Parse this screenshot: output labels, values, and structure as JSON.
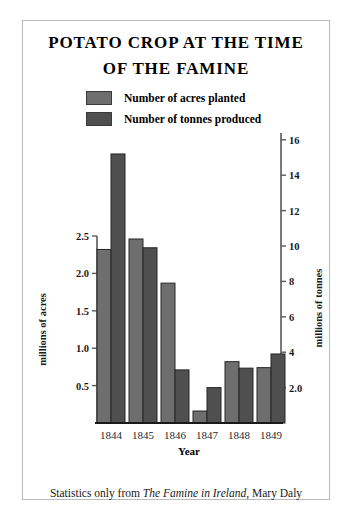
{
  "title": {
    "line1": "POTATO CROP AT THE TIME",
    "line2": "OF THE FAMINE"
  },
  "legend": {
    "position": "top-center",
    "items": [
      {
        "label": "Number of acres planted",
        "color": "#6e6e6e",
        "swatch_name": "legend-swatch-acres"
      },
      {
        "label": "Number of tonnes produced",
        "color": "#4f4f4f",
        "swatch_name": "legend-swatch-tonnes"
      }
    ]
  },
  "caption": {
    "prefix": "Statistics only from ",
    "source_title": "The Famine in Ireland",
    "suffix": ", Mary Daly"
  },
  "axes": {
    "left": {
      "label": "millions of acres",
      "ticks": [
        "0.5",
        "1.0",
        "1.5",
        "2.0",
        "2.5"
      ],
      "tick_values": [
        0.5,
        1.0,
        1.5,
        2.0,
        2.5
      ],
      "min": 0,
      "max": 2.5
    },
    "right": {
      "label": "millions of tonnes",
      "ticks": [
        "2.0",
        "4",
        "6",
        "8",
        "10",
        "12",
        "14",
        "16"
      ],
      "tick_values": [
        2,
        4,
        6,
        8,
        10,
        12,
        14,
        16
      ],
      "min": 0,
      "max": 16
    },
    "bottom": {
      "label": "Year",
      "ticks": [
        "1844",
        "1845",
        "1846",
        "1847",
        "1848",
        "1849"
      ]
    }
  },
  "chart_data": {
    "type": "bar",
    "title": "POTATO CROP AT THE TIME OF THE FAMINE",
    "subtitle": "",
    "categories": [
      "1844",
      "1845",
      "1846",
      "1847",
      "1848",
      "1849"
    ],
    "series": [
      {
        "name": "Number of acres planted",
        "unit": "millions of acres",
        "axis": "left",
        "color": "#6e6e6e",
        "values": [
          2.32,
          2.46,
          1.87,
          0.16,
          0.82,
          0.74
        ]
      },
      {
        "name": "Number of tonnes produced",
        "unit": "millions of tonnes",
        "axis": "right",
        "color": "#4f4f4f",
        "values": [
          15.2,
          9.9,
          3.0,
          2.0,
          3.1,
          3.9
        ]
      }
    ],
    "xlabel": "Year",
    "ylabel": "millions of acres",
    "y2label": "millions of tonnes",
    "ylim": [
      0,
      2.5
    ],
    "y2lim": [
      0,
      16
    ],
    "grid": false,
    "legend_position": "top-center",
    "annotation": "Statistics only from The Famine in Ireland, Mary Daly"
  },
  "geometry": {
    "baseline_y": 423,
    "left_axis_top_y": 236,
    "right_axis_top_y": 133,
    "acres_px_per_unit": 74.8,
    "tonnes_px_per_unit": 17.7,
    "group_xs": [
      97,
      129,
      161,
      193,
      225,
      257
    ],
    "bar_width": 14
  }
}
